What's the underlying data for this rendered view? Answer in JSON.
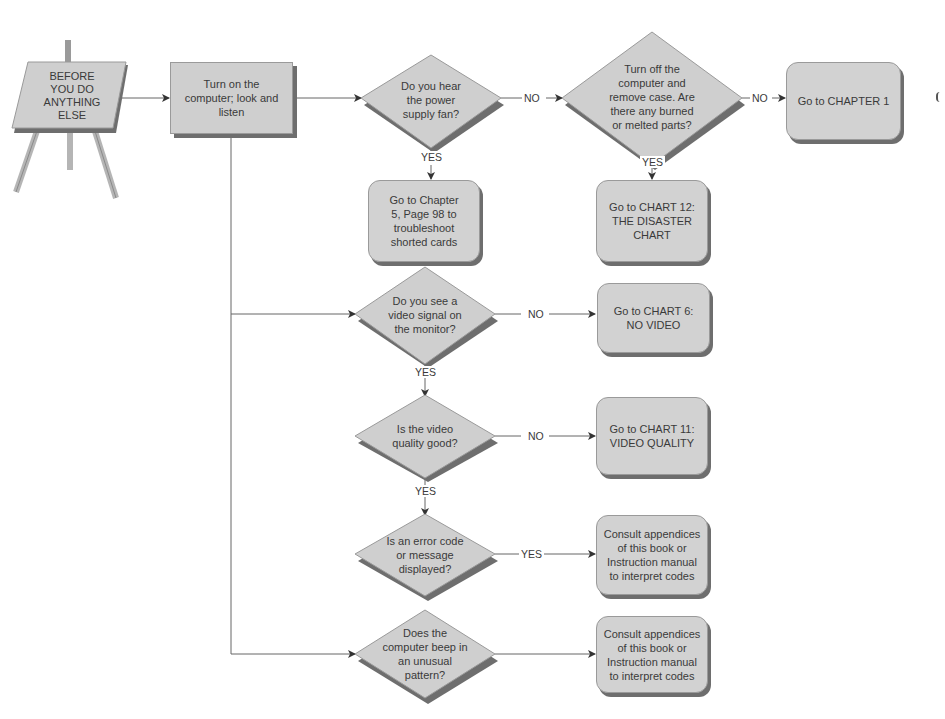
{
  "start": {
    "label": "BEFORE\nYOU DO\nANYTHING\nELSE"
  },
  "step_turn_on": {
    "label": "Turn on the\ncomputer; look and\nlisten"
  },
  "decisions": [
    {
      "id": "fan",
      "label": "Do you hear\nthe power\nsupply fan?"
    },
    {
      "id": "burned",
      "label": "Turn off the\ncomputer and\nremove case. Are\nthere any burned\nor melted parts?"
    },
    {
      "id": "video_signal",
      "label": "Do you see a\nvideo signal on\nthe monitor?"
    },
    {
      "id": "video_quality",
      "label": "Is the video\nquality good?"
    },
    {
      "id": "error_code",
      "label": "Is an error code\nor message\ndisplayed?"
    },
    {
      "id": "beep",
      "label": "Does the\ncomputer beep in\nan unusual\npattern?"
    }
  ],
  "outcomes": [
    {
      "id": "chapter1",
      "label": "Go to CHAPTER 1"
    },
    {
      "id": "chapter5",
      "label": "Go to Chapter\n5, Page 98 to\ntroubleshoot\nshorted cards"
    },
    {
      "id": "chart12",
      "label": "Go to CHART 12:\nTHE DISASTER\nCHART"
    },
    {
      "id": "chart6",
      "label": "Go to CHART 6:\nNO VIDEO"
    },
    {
      "id": "chart11",
      "label": "Go to CHART 11:\nVIDEO QUALITY"
    },
    {
      "id": "consult1",
      "label": "Consult appendices\nof this book or\nInstruction manual\nto interpret codes"
    },
    {
      "id": "consult2",
      "label": "Consult appendices\nof this book or\nInstruction manual\nto interpret codes"
    }
  ],
  "edge_labels": {
    "fan_no": "NO",
    "fan_yes": "YES",
    "burned_no": "NO",
    "burned_yes": "YES",
    "video_signal_no": "NO",
    "video_signal_yes": "YES",
    "video_quality_no": "NO",
    "video_quality_yes": "YES",
    "error_code_yes": "YES"
  },
  "colors": {
    "node_fill": "#cfcfcf",
    "shadow": "#6e6e6e",
    "line": "#666666",
    "background": "#ffffff"
  }
}
